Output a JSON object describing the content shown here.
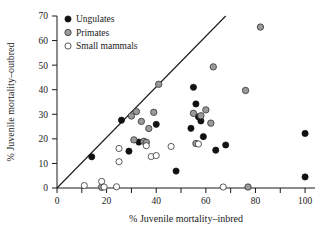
{
  "chart_data": {
    "type": "scatter",
    "title": "",
    "xlabel": "% Juvenile mortality–inbred",
    "ylabel": "% Juvenile mortality–outbred",
    "xlim": [
      0,
      104
    ],
    "ylim": [
      0,
      70
    ],
    "xticks": [
      0,
      10,
      20,
      30,
      40,
      50,
      60,
      70,
      80,
      90,
      100
    ],
    "xtick_labels": [
      "0",
      "",
      "20",
      "",
      "40",
      "",
      "60",
      "",
      "80",
      "",
      "100"
    ],
    "yticks": [
      0,
      10,
      20,
      30,
      40,
      50,
      60,
      70
    ],
    "ytick_labels": [
      "0",
      "10",
      "20",
      "30",
      "40",
      "50",
      "60",
      "70"
    ],
    "grid": false,
    "legend_position": "top-left",
    "reference_line": {
      "name": "one-to-one-line",
      "x": [
        0,
        68
      ],
      "y": [
        0,
        70
      ],
      "slope": 1,
      "intercept": 0
    },
    "series": [
      {
        "name": "Ungulates",
        "marker": "filled-circle",
        "color": "#111111",
        "points": [
          [
            14,
            12.7
          ],
          [
            26,
            27.6
          ],
          [
            29,
            15.0
          ],
          [
            33,
            18.7
          ],
          [
            40,
            25.9
          ],
          [
            48,
            6.9
          ],
          [
            54,
            24.3
          ],
          [
            55,
            41.0
          ],
          [
            56,
            34.2
          ],
          [
            57,
            29.0
          ],
          [
            58,
            27.3
          ],
          [
            59,
            20.9
          ],
          [
            64,
            15.4
          ],
          [
            68,
            17.5
          ],
          [
            100,
            22.2
          ],
          [
            100,
            4.5
          ]
        ]
      },
      {
        "name": "Primates",
        "marker": "gray-circle",
        "color": "#9a9a9a",
        "points": [
          [
            18,
            0.3
          ],
          [
            30,
            29.3
          ],
          [
            31,
            19.6
          ],
          [
            32,
            31.1
          ],
          [
            34,
            27.1
          ],
          [
            35,
            19.0
          ],
          [
            36,
            18.6
          ],
          [
            37,
            24.2
          ],
          [
            39,
            30.8
          ],
          [
            41,
            42.2
          ],
          [
            55,
            30.4
          ],
          [
            56,
            18.1
          ],
          [
            58,
            29.4
          ],
          [
            60,
            31.8
          ],
          [
            62,
            26.4
          ],
          [
            63,
            49.3
          ],
          [
            76,
            39.7
          ],
          [
            77,
            0.4
          ],
          [
            82,
            65.5
          ]
        ]
      },
      {
        "name": "Small mammals",
        "marker": "open-circle",
        "color": "#ffffff",
        "points": [
          [
            11,
            1.0
          ],
          [
            18,
            2.7
          ],
          [
            19,
            0.4
          ],
          [
            24,
            0.5
          ],
          [
            25,
            16.1
          ],
          [
            25,
            10.7
          ],
          [
            36,
            17.2
          ],
          [
            38,
            12.8
          ],
          [
            40,
            13.2
          ],
          [
            46,
            16.9
          ],
          [
            57,
            17.9
          ],
          [
            67,
            0.4
          ]
        ]
      }
    ]
  },
  "legend": {
    "items": [
      {
        "label": "Ungulates",
        "marker": "filled-circle"
      },
      {
        "label": "Primates",
        "marker": "gray-circle"
      },
      {
        "label": "Small mammals",
        "marker": "open-circle"
      }
    ]
  }
}
